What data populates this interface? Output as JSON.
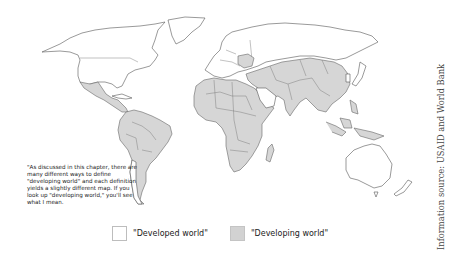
{
  "figure": {
    "type": "world-map",
    "colors": {
      "developed_fill": "#ffffff",
      "developing_fill": "#d6d6d6",
      "border": "#555555",
      "background": "#ffffff"
    },
    "regions": {
      "developed": [
        "North America (Canada, USA)",
        "Greenland",
        "Europe",
        "Russia",
        "Japan",
        "South Korea",
        "Australia",
        "New Zealand",
        "Saudi Arabia",
        "Chile",
        "Uruguay",
        "Venezuela",
        "Cuba"
      ],
      "developing": [
        "Mexico",
        "Central America",
        "South America",
        "Africa",
        "Middle East",
        "Central Asia",
        "South Asia",
        "China",
        "Southeast Asia",
        "Mongolia",
        "Madagascar",
        "Papua New Guinea"
      ]
    }
  },
  "annotation": {
    "text": "\"As discussed in this chapter, there are many different ways to define \"developing world\" and each definition yields a slightly different map. If you look up \"developing world,\" you'll see what I mean."
  },
  "legend": {
    "items": [
      {
        "label": "\"Developed world\"",
        "swatch": "developed"
      },
      {
        "label": "\"Developing world\"",
        "swatch": "developing"
      }
    ]
  },
  "source": {
    "text": "Information source: USAID and World Bank"
  }
}
